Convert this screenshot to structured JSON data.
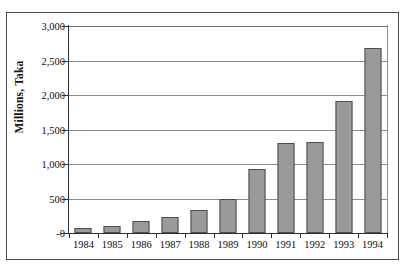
{
  "clipped_caption": "",
  "chart_data": {
    "type": "bar",
    "title": "",
    "subtitle": "",
    "xlabel": "",
    "ylabel": "Millions, Taka",
    "categories": [
      "1984",
      "1985",
      "1986",
      "1987",
      "1988",
      "1989",
      "1990",
      "1991",
      "1992",
      "1993",
      "1994"
    ],
    "values": [
      70,
      105,
      180,
      235,
      330,
      490,
      925,
      1305,
      1325,
      1920,
      2680
    ],
    "ylim": [
      0,
      3000
    ],
    "y_ticks": [
      0,
      500,
      1000,
      1500,
      2000,
      2500,
      3000
    ],
    "y_tick_labels": [
      "-0",
      "500",
      "1,000",
      "1,500",
      "2,000",
      "2,500",
      "3,000"
    ],
    "grid": true,
    "legend": false,
    "legend_position": "none",
    "bar_color": "#9a9a9a",
    "bar_border_color": "#4f4f4f",
    "gridline_color": "#8d8d8d",
    "axis_color": "#2f2f2f",
    "frame_color": "#4a4a4a",
    "text_color": "#0e0e0e"
  }
}
